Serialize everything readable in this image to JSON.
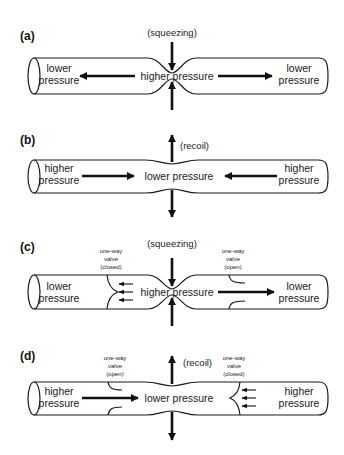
{
  "figure": {
    "panels": [
      {
        "id": "a",
        "label": "(a)",
        "force": "(squeezing)",
        "left_text": [
          "lower",
          "pressure"
        ],
        "center_text": "higher pressure",
        "right_text": [
          "lower",
          "pressure"
        ]
      },
      {
        "id": "b",
        "label": "(b)",
        "force": "(recoil)",
        "left_text": [
          "higher",
          "pressure"
        ],
        "center_text": "lower pressure",
        "right_text": [
          "higher",
          "pressure"
        ]
      },
      {
        "id": "c",
        "label": "(c)",
        "force": "(squeezing)",
        "left_text": [
          "lower",
          "pressure"
        ],
        "center_text": "higher pressure",
        "right_text": [
          "lower",
          "pressure"
        ],
        "left_valve": [
          "one-way",
          "valve",
          "(closed)"
        ],
        "right_valve": [
          "one-way",
          "valve",
          "(open)"
        ]
      },
      {
        "id": "d",
        "label": "(d)",
        "force": "(recoil)",
        "left_text": [
          "higher",
          "pressure"
        ],
        "center_text": "lower pressure",
        "right_text": [
          "higher",
          "pressure"
        ],
        "left_valve": [
          "one-way",
          "valve",
          "(open)"
        ],
        "right_valve": [
          "one-way",
          "valve",
          "(closed)"
        ]
      }
    ]
  }
}
